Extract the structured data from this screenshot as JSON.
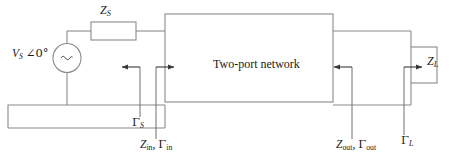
{
  "diagram": {
    "type": "circuit-schematic",
    "canvas": {
      "width": 461,
      "height": 164
    },
    "colors": {
      "wire": "#8a8a8a",
      "outline": "#8a8a8a",
      "arrow": "#3a3a3a",
      "text": "#1a1a1a",
      "background": "#ffffff"
    },
    "components": {
      "source": {
        "name": "voltage-source",
        "label_magnitude": "V",
        "label_magnitude_sub": "S",
        "label_angle": "∠0°",
        "symbol": "~"
      },
      "source_impedance": {
        "name": "source-impedance",
        "label_main": "Z",
        "label_sub": "S"
      },
      "two_port": {
        "name": "two-port-network",
        "label": "Two-port network"
      },
      "load_impedance": {
        "name": "load-impedance",
        "label_main": "Z",
        "label_sub": "L"
      }
    },
    "annotations": [
      {
        "name": "gamma-s",
        "main": "Γ",
        "sub": "S",
        "direction": "left",
        "port": "input"
      },
      {
        "name": "z-in-gamma-in",
        "main": "Z",
        "sub": "in",
        "second_main": "Γ",
        "second_sub": "in",
        "separator": ", ",
        "direction": "right",
        "port": "input"
      },
      {
        "name": "z-out-gamma-out",
        "main": "Z",
        "sub": "out",
        "second_main": "Γ",
        "second_sub": "out",
        "separator": ", ",
        "direction": "left",
        "port": "output"
      },
      {
        "name": "gamma-l",
        "main": "Γ",
        "sub": "L",
        "direction": "right",
        "port": "output"
      }
    ]
  }
}
